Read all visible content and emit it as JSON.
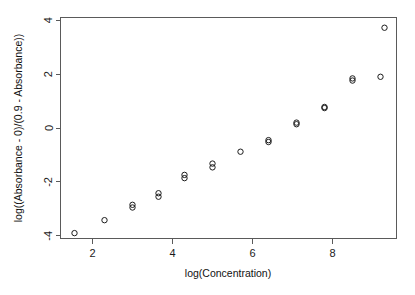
{
  "chart_data": {
    "type": "scatter",
    "title": "",
    "xlabel": "log(Concentration)",
    "ylabel": "log((Absorbance - 0)/(0.9 - Absorbance))",
    "xlim": [
      1.2,
      9.6
    ],
    "ylim": [
      -4.1,
      4.1
    ],
    "xticks": [
      2,
      4,
      6,
      8
    ],
    "yticks": [
      -4,
      -2,
      0,
      2,
      4
    ],
    "xtick_labels": [
      "2",
      "4",
      "6",
      "8"
    ],
    "ytick_labels": [
      "-4",
      "-2",
      "0",
      "2",
      "4"
    ],
    "grid": false,
    "legend": null,
    "marker": "open-circle",
    "marker_color": "#1c1c1c",
    "n_points": 23,
    "x": [
      1.55,
      2.3,
      3.0,
      3.0,
      3.65,
      3.65,
      4.3,
      4.3,
      5.0,
      5.0,
      5.7,
      6.4,
      6.4,
      7.1,
      7.1,
      7.8,
      7.8,
      8.5,
      8.5,
      9.2,
      9.3
    ],
    "y": [
      -3.9,
      -3.42,
      -2.95,
      -2.85,
      -2.55,
      -2.42,
      -1.86,
      -1.74,
      -1.46,
      -1.32,
      -0.88,
      -0.52,
      -0.45,
      0.14,
      0.2,
      0.74,
      0.78,
      1.76,
      1.84,
      1.9,
      3.72
    ],
    "points": [
      {
        "x": 1.55,
        "y": -3.9
      },
      {
        "x": 2.3,
        "y": -3.42
      },
      {
        "x": 3.0,
        "y": -2.95
      },
      {
        "x": 3.0,
        "y": -2.85
      },
      {
        "x": 3.65,
        "y": -2.55
      },
      {
        "x": 3.65,
        "y": -2.42
      },
      {
        "x": 4.3,
        "y": -1.86
      },
      {
        "x": 4.3,
        "y": -1.74
      },
      {
        "x": 5.0,
        "y": -1.46
      },
      {
        "x": 5.0,
        "y": -1.32
      },
      {
        "x": 5.7,
        "y": -0.88
      },
      {
        "x": 6.4,
        "y": -0.52
      },
      {
        "x": 6.4,
        "y": -0.45
      },
      {
        "x": 7.1,
        "y": 0.14
      },
      {
        "x": 7.1,
        "y": 0.2
      },
      {
        "x": 7.8,
        "y": 0.74
      },
      {
        "x": 7.8,
        "y": 0.78
      },
      {
        "x": 8.5,
        "y": 1.76
      },
      {
        "x": 8.5,
        "y": 1.84
      },
      {
        "x": 9.2,
        "y": 1.9
      },
      {
        "x": 9.3,
        "y": 3.72
      }
    ]
  }
}
